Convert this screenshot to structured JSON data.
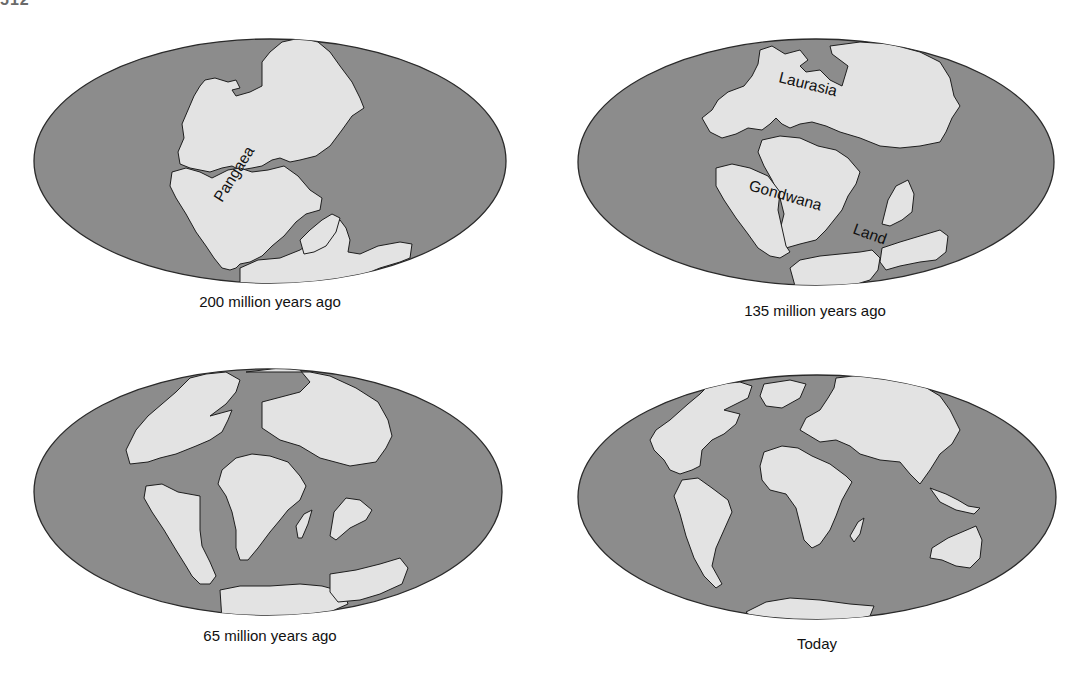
{
  "page": {
    "number": "512"
  },
  "figure": {
    "panels": [
      {
        "id": "200mya",
        "caption": "200 million years ago",
        "labels": [
          "Pangaea"
        ]
      },
      {
        "id": "135mya",
        "caption": "135 million years ago",
        "labels": [
          "Laurasia",
          "Gondwana",
          "Land"
        ]
      },
      {
        "id": "65mya",
        "caption": "65 million years ago",
        "labels": []
      },
      {
        "id": "today",
        "caption": "Today",
        "labels": []
      }
    ],
    "colors": {
      "ocean": "#8c8c8c",
      "land": "#e3e3e3",
      "outline": "#1e1e1e"
    }
  }
}
